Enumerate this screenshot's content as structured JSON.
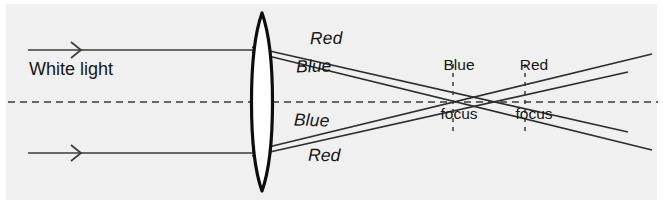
{
  "figure": {
    "background_color": "#f0f0f0",
    "ink_color": "#2e2e2e",
    "width": 663,
    "height": 204
  },
  "labels": {
    "white_light": "White light",
    "red_top": "Red",
    "blue_top": "Blue",
    "blue_bottom": "Blue",
    "red_bottom": "Red",
    "blue_focus_line1": "Blue",
    "blue_focus_line2": "focus",
    "red_focus_line1": "Red",
    "red_focus_line2": "focus"
  },
  "optics": {
    "optical_axis_y": 102,
    "lens": {
      "center_x": 262,
      "top_y": 13,
      "bottom_y": 191,
      "half_width": 12.5,
      "type": "biconvex"
    },
    "incoming_rays": [
      {
        "name": "upper-ray",
        "y": 50,
        "x_start": 28,
        "x_end": 262,
        "arrow_x": 78
      },
      {
        "name": "lower-ray",
        "y": 153,
        "x_start": 28,
        "x_end": 262,
        "arrow_x": 78
      }
    ],
    "focus_markers": [
      {
        "name": "blue-focus",
        "x": 453,
        "dash_top_y": 64,
        "dash_bottom_y": 132
      },
      {
        "name": "red-focus",
        "x": 525,
        "dash_top_y": 64,
        "dash_bottom_y": 132
      }
    ],
    "refracted_rays": [
      {
        "name": "upper-blue",
        "from_x": 258,
        "from_y": 53,
        "focus_x": 453,
        "end_x": 652
      },
      {
        "name": "upper-red",
        "from_x": 258,
        "from_y": 48,
        "focus_x": 525,
        "end_x": 628
      },
      {
        "name": "lower-blue",
        "from_x": 258,
        "from_y": 150,
        "focus_x": 453,
        "end_x": 652
      },
      {
        "name": "lower-red",
        "from_x": 258,
        "from_y": 155,
        "focus_x": 525,
        "end_x": 628
      }
    ]
  }
}
